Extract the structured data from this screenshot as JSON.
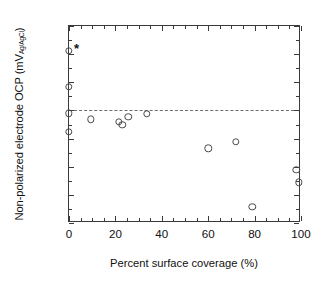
{
  "figure": {
    "background_color": "#ffffff",
    "axis_color": "#3a3a3a",
    "marker_color": "#4a4a4a",
    "refline_color": "#6d6d6d"
  },
  "axes": {
    "ylabel_main": "Non-polarized electrode OCP (mV",
    "ylabel_sub": "Ag/AgCl",
    "ylabel_close": ")",
    "xlabel": "Percent surface coverage (%)",
    "ytick_labels": [
      "500",
      "400",
      "300",
      "200",
      "100",
      "0",
      "-100",
      "-200"
    ],
    "ytick_values": [
      500,
      400,
      300,
      200,
      100,
      0,
      -100,
      -200
    ],
    "xtick_labels": [
      "0",
      "20",
      "40",
      "60",
      "80",
      "100"
    ],
    "xtick_values": [
      0,
      20,
      40,
      60,
      80,
      100
    ]
  },
  "annotations": {
    "asterisk": "*",
    "asterisk_x": 3.2,
    "asterisk_y": 422
  },
  "chart_data": {
    "type": "scatter",
    "title": "",
    "xlabel": "Percent surface coverage (%)",
    "ylabel": "Non-polarized electrode OCP (mV Ag/AgCl)",
    "xlim": [
      0,
      100
    ],
    "ylim": [
      -200,
      500
    ],
    "xticks": [
      0,
      20,
      40,
      60,
      80,
      100
    ],
    "yticks": [
      500,
      400,
      300,
      200,
      100,
      0,
      -100,
      -200
    ],
    "grid": false,
    "legend": null,
    "marker": "open-circle",
    "reference_lines": [
      {
        "orientation": "horizontal",
        "y": 200,
        "style": "dashed"
      }
    ],
    "annotations": [
      {
        "text": "*",
        "x": 3.2,
        "y": 422
      }
    ],
    "series": [
      {
        "name": "Non-polarized electrode OCP",
        "points": [
          {
            "x": 0.0,
            "y": 412
          },
          {
            "x": 0.0,
            "y": 285
          },
          {
            "x": 0.0,
            "y": 190
          },
          {
            "x": 0.0,
            "y": 125
          },
          {
            "x": 9.5,
            "y": 168
          },
          {
            "x": 21.5,
            "y": 160
          },
          {
            "x": 23.0,
            "y": 150
          },
          {
            "x": 25.5,
            "y": 178
          },
          {
            "x": 33.5,
            "y": 188
          },
          {
            "x": 60.0,
            "y": 65
          },
          {
            "x": 72.0,
            "y": 88
          },
          {
            "x": 79.0,
            "y": -142
          },
          {
            "x": 98.0,
            "y": -10
          },
          {
            "x": 99.0,
            "y": -55
          }
        ]
      }
    ]
  }
}
